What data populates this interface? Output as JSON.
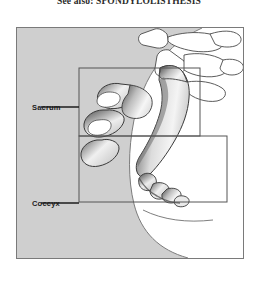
{
  "caption": {
    "text": "See also: SPONDYLOLISTHESIS"
  },
  "figure": {
    "labels": [
      {
        "id": "sacrum",
        "text": "Sacrum"
      },
      {
        "id": "coccyx",
        "text": "Coccyx"
      }
    ],
    "colors": {
      "frame_border": "#7a7a7a",
      "body_shade": "#cfcfcf",
      "body_shade_dark": "#c4c4c4",
      "bone_outline": "#3a3a3a",
      "bone_fill": "#ffffff",
      "bone_shadow": "#4a4a4a",
      "callout_border": "#555555",
      "leader_line": "#1c1c1c",
      "text": "#1c1c1c"
    },
    "callout_boxes": [
      {
        "id": "sacrum-callout",
        "x": 62,
        "y": 40,
        "w": 121,
        "h": 68
      },
      {
        "id": "coccyx-callout",
        "x": 62,
        "y": 108,
        "w": 148,
        "h": 66
      }
    ]
  }
}
